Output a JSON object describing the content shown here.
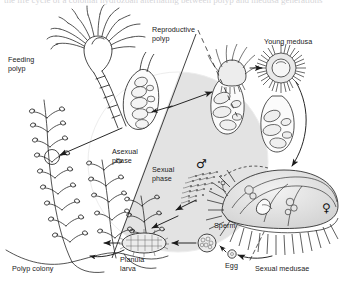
{
  "figure": {
    "cropped_caption_line": "the life cycle of a colonial hydrozoan alternating between polyp and medusa generations",
    "background_color": "#ffffff",
    "ink_color": "#1b1b1b",
    "shade_color": "#e3e3e3",
    "phase_divider": "diagonal line splitting the central circle"
  },
  "labels": {
    "feeding_polyp": "Feeding\npolyp",
    "reproductive_polyp": "Reproductive\npolyp",
    "young_medusa": "Young medusa",
    "asexual_phase": "Asexual\nphase",
    "sexual_phase": "Sexual\nphase",
    "sperm": "Sperm",
    "egg": "Egg",
    "sexual_medusae": "Sexual medusae",
    "planula_larva": "Planula\nlarva",
    "polyp_colony": "Polyp colony"
  },
  "symbols": {
    "male": "♂",
    "female": "♀"
  },
  "stages": [
    {
      "name": "polyp-colony",
      "label": "Polyp colony",
      "phase": "asexual"
    },
    {
      "name": "feeding-polyp",
      "label": "Feeding polyp",
      "phase": "asexual"
    },
    {
      "name": "reproductive-polyp",
      "label": "Reproductive polyp",
      "phase": "asexual"
    },
    {
      "name": "young-medusa",
      "label": "Young medusa",
      "phase": "transition"
    },
    {
      "name": "sexual-medusae",
      "label": "Sexual medusae",
      "phase": "sexual"
    },
    {
      "name": "sperm",
      "label": "Sperm",
      "phase": "sexual"
    },
    {
      "name": "egg",
      "label": "Egg",
      "phase": "sexual"
    },
    {
      "name": "planula-larva",
      "label": "Planula larva",
      "phase": "sexual"
    }
  ]
}
